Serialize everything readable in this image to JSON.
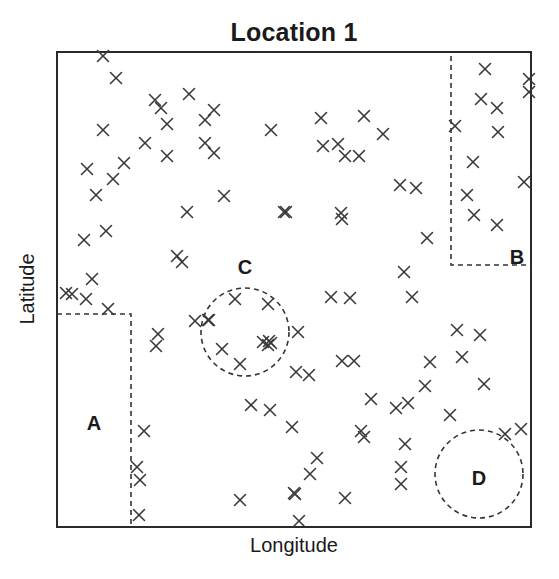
{
  "chart_data": {
    "type": "scatter",
    "title": "Location 1",
    "xlabel": "Longitude",
    "ylabel": "Latitude",
    "marker": "x",
    "grid": false,
    "legend": null,
    "axis_ticks": "none",
    "coordinate_note": "x,y in plot pixels: x from left frame edge (0..474), y from top frame edge (0..475)",
    "frame": {
      "x": 57,
      "y": 52,
      "width": 474,
      "height": 475
    },
    "points": [
      [
        46,
        4
      ],
      [
        59,
        26
      ],
      [
        98,
        48
      ],
      [
        132,
        42
      ],
      [
        104,
        56
      ],
      [
        157,
        58
      ],
      [
        110,
        72
      ],
      [
        148,
        68
      ],
      [
        46,
        78
      ],
      [
        67,
        111
      ],
      [
        88,
        91
      ],
      [
        148,
        91
      ],
      [
        157,
        101
      ],
      [
        110,
        104
      ],
      [
        214,
        78
      ],
      [
        264,
        66
      ],
      [
        307,
        64
      ],
      [
        266,
        94
      ],
      [
        281,
        92
      ],
      [
        288,
        104
      ],
      [
        302,
        104
      ],
      [
        326,
        82
      ],
      [
        428,
        17
      ],
      [
        472,
        27
      ],
      [
        472,
        40
      ],
      [
        424,
        47
      ],
      [
        440,
        56
      ],
      [
        398,
        74
      ],
      [
        441,
        80
      ],
      [
        416,
        110
      ],
      [
        467,
        130
      ],
      [
        410,
        143
      ],
      [
        417,
        163
      ],
      [
        440,
        173
      ],
      [
        30,
        117
      ],
      [
        56,
        127
      ],
      [
        49,
        179
      ],
      [
        39,
        143
      ],
      [
        130,
        160
      ],
      [
        167,
        144
      ],
      [
        227,
        160
      ],
      [
        229,
        160
      ],
      [
        284,
        161
      ],
      [
        285,
        167
      ],
      [
        343,
        133
      ],
      [
        359,
        136
      ],
      [
        370,
        186
      ],
      [
        27,
        188
      ],
      [
        120,
        204
      ],
      [
        125,
        210
      ],
      [
        9,
        241
      ],
      [
        15,
        242
      ],
      [
        35,
        227
      ],
      [
        29,
        247
      ],
      [
        51,
        257
      ],
      [
        347,
        220
      ],
      [
        355,
        245
      ],
      [
        274,
        245
      ],
      [
        293,
        246
      ],
      [
        101,
        282
      ],
      [
        99,
        294
      ],
      [
        138,
        269
      ],
      [
        152,
        268
      ],
      [
        178,
        247
      ],
      [
        151,
        268
      ],
      [
        211,
        252
      ],
      [
        241,
        280
      ],
      [
        211,
        293
      ],
      [
        206,
        290
      ],
      [
        214,
        291
      ],
      [
        183,
        312
      ],
      [
        165,
        297
      ],
      [
        212,
        289
      ],
      [
        239,
        320
      ],
      [
        252,
        323
      ],
      [
        285,
        309
      ],
      [
        297,
        309
      ],
      [
        373,
        310
      ],
      [
        400,
        278
      ],
      [
        423,
        283
      ],
      [
        405,
        305
      ],
      [
        427,
        332
      ],
      [
        351,
        351
      ],
      [
        368,
        334
      ],
      [
        314,
        347
      ],
      [
        339,
        356
      ],
      [
        194,
        353
      ],
      [
        213,
        358
      ],
      [
        235,
        375
      ],
      [
        304,
        379
      ],
      [
        307,
        385
      ],
      [
        348,
        392
      ],
      [
        260,
        406
      ],
      [
        253,
        422
      ],
      [
        238,
        442
      ],
      [
        183,
        448
      ],
      [
        237,
        441
      ],
      [
        288,
        446
      ],
      [
        242,
        469
      ],
      [
        87,
        379
      ],
      [
        80,
        415
      ],
      [
        83,
        428
      ],
      [
        82,
        463
      ],
      [
        344,
        415
      ],
      [
        344,
        432
      ],
      [
        448,
        382
      ],
      [
        464,
        377
      ],
      [
        393,
        363
      ]
    ],
    "regions": [
      {
        "label": "A",
        "shape": "polyline",
        "points": [
          [
            0,
            262
          ],
          [
            74,
            262
          ],
          [
            74,
            475
          ]
        ],
        "label_pos": [
          37,
          371
        ]
      },
      {
        "label": "B",
        "shape": "polyline",
        "points": [
          [
            394,
            4
          ],
          [
            394,
            213
          ],
          [
            474,
            213
          ]
        ],
        "label_pos": [
          460,
          205
        ]
      },
      {
        "label": "C",
        "shape": "ellipse",
        "cx": 188,
        "cy": 280,
        "rx": 44,
        "ry": 44,
        "label_pos": [
          188,
          215
        ]
      },
      {
        "label": "D",
        "shape": "ellipse",
        "cx": 422,
        "cy": 422,
        "rx": 44,
        "ry": 44,
        "label_pos": [
          422,
          426
        ]
      }
    ]
  }
}
